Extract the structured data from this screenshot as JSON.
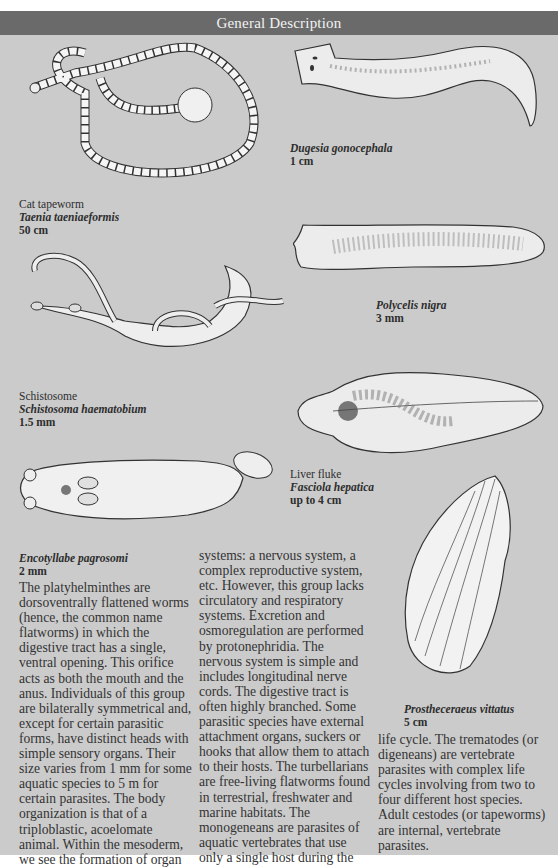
{
  "header": {
    "title": "General Description"
  },
  "figures": [
    {
      "id": "cat-tapeworm",
      "common_name": "Cat tapeworm",
      "scientific_name": "Taenia taeniaeformis",
      "size": "50 cm"
    },
    {
      "id": "dugesia",
      "common_name": "",
      "scientific_name": "Dugesia gonocephala",
      "size": "1 cm"
    },
    {
      "id": "polycelis",
      "common_name": "",
      "scientific_name": "Polycelis nigra",
      "size": "3 mm"
    },
    {
      "id": "schistosome",
      "common_name": "Schistosome",
      "scientific_name": "Schistosoma haematobium",
      "size": "1.5 mm"
    },
    {
      "id": "liver-fluke",
      "common_name": "Liver fluke",
      "scientific_name": "Fasciola hepatica",
      "size": "up to 4 cm"
    },
    {
      "id": "encotyllabe",
      "common_name": "",
      "scientific_name": "Encotyllabe pagrosomi",
      "size": "2 mm"
    },
    {
      "id": "prostheceraeus",
      "common_name": "",
      "scientific_name": "Prostheceraeus vittatus",
      "size": "5 cm"
    }
  ],
  "body_text": {
    "col1": [
      "The platyhelminthes are",
      "dorsoventrally flattened worms",
      "(hence, the common name",
      "flatworms) in which the",
      "digestive tract has a single,",
      "ventral opening. This orifice",
      "acts as both the mouth and the",
      "anus. Individuals of this group",
      "are bilaterally symmetrical and,",
      "except for certain parasitic",
      "forms, have distinct heads with",
      "simple sensory organs. Their",
      "size varies from 1 mm for some",
      "aquatic species to 5 m for",
      "certain parasites. The body",
      "organization is that of a",
      "triploblastic, acoelomate",
      "animal. Within the mesoderm,",
      "we see the formation of organ"
    ],
    "col2": [
      "systems: a nervous system, a",
      "complex reproductive system,",
      "etc. However, this group lacks",
      "circulatory and respiratory",
      "systems. Excretion and",
      "osmoregulation are performed",
      "by protonephridia. The",
      "nervous system is simple and",
      "includes longitudinal nerve",
      "cords. The digestive tract is",
      "often highly branched. Some",
      "parasitic species have external",
      "attachment organs, suckers or",
      "hooks that allow them to attach",
      "to their hosts. The turbellarians",
      "are free-living flatworms found",
      "in terrestrial, freshwater and",
      "marine habitats. The",
      "monogeneans are parasites of",
      "aquatic vertebrates that use",
      "only a single host during the"
    ],
    "col3": [
      "life cycle. The trematodes (or",
      "digeneans) are vertebrate",
      "parasites with complex life",
      "cycles involving from two to",
      "four different host species.",
      "Adult cestodes (or tapeworms)",
      "are internal, vertebrate",
      "parasites."
    ]
  },
  "colors": {
    "header_bg": "#6a6a6a",
    "page_bg": "#cbcbcb",
    "header_text": "#f2f2f2"
  }
}
